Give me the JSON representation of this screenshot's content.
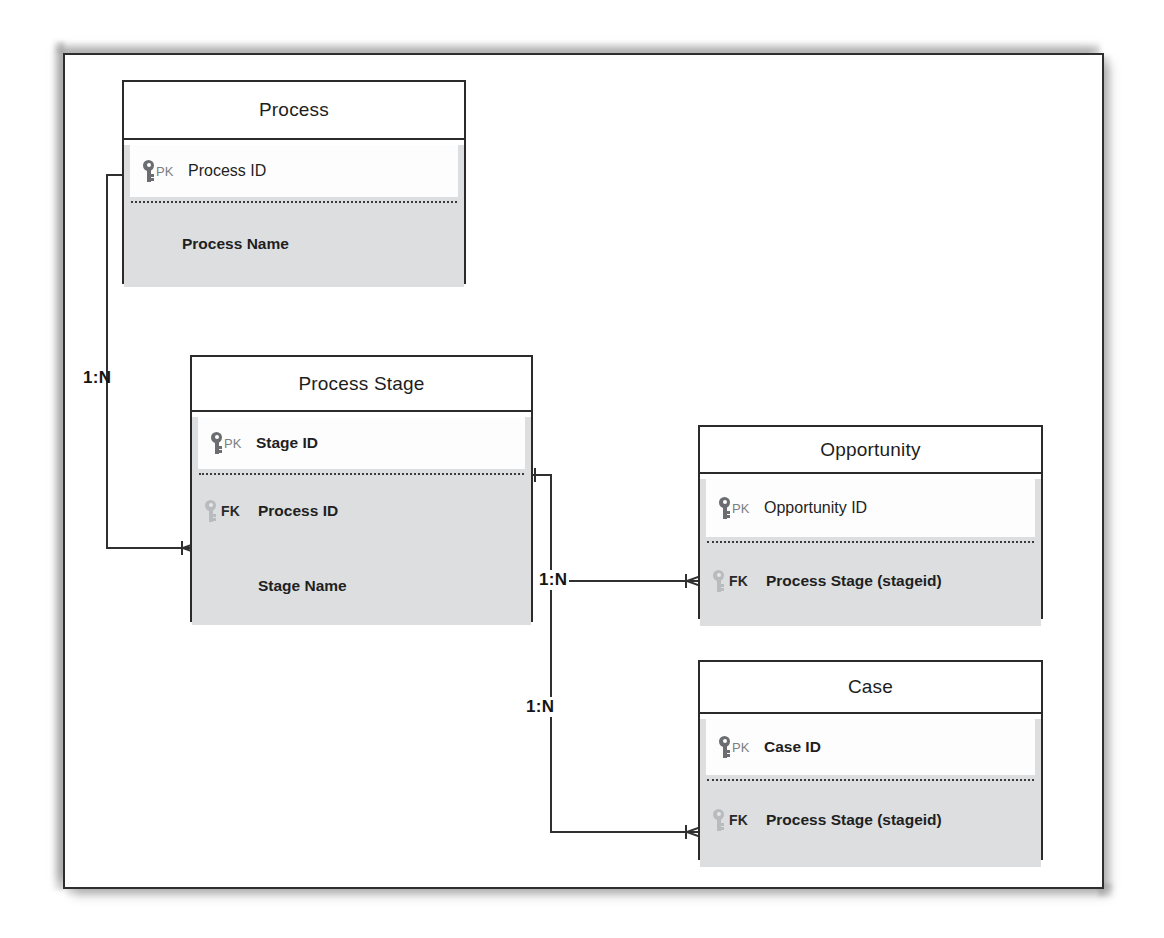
{
  "diagram": {
    "title_present": false,
    "notation": "crow's foot ER diagram",
    "colors": {
      "entity_border": "#2b2b2b",
      "entity_header_bg": "#ffffff",
      "entity_body_bg": "#dcdee0",
      "pk_band_bg": "#fdfdfd",
      "connector": "#303030",
      "pk_key_icon": "#6b6d70",
      "fk_key_icon": "#b9bcbf",
      "text": "#1f1f1f"
    },
    "entities": [
      {
        "id": "process",
        "name": "Process",
        "pk": {
          "tag": "PK",
          "label": "Process ID",
          "icon": "key-icon"
        },
        "attributes": [
          {
            "tag": "",
            "label": "Process Name",
            "icon": ""
          }
        ]
      },
      {
        "id": "process-stage",
        "name": "Process Stage",
        "pk": {
          "tag": "PK",
          "label": "Stage ID",
          "icon": "key-icon"
        },
        "attributes": [
          {
            "tag": "FK",
            "label": "Process ID",
            "icon": "key-icon"
          },
          {
            "tag": "",
            "label": "Stage Name",
            "icon": ""
          }
        ]
      },
      {
        "id": "opportunity",
        "name": "Opportunity",
        "pk": {
          "tag": "PK",
          "label": "Opportunity ID",
          "icon": "key-icon"
        },
        "attributes": [
          {
            "tag": "FK",
            "label": "Process Stage (stageid)",
            "icon": "key-icon"
          }
        ]
      },
      {
        "id": "case",
        "name": "Case",
        "pk": {
          "tag": "PK",
          "label": "Case ID",
          "icon": "key-icon"
        },
        "attributes": [
          {
            "tag": "FK",
            "label": "Process Stage (stageid)",
            "icon": "key-icon"
          }
        ]
      }
    ],
    "relationships": [
      {
        "id": "process-to-stage",
        "from": "Process.Process ID",
        "to": "Process Stage.Process ID",
        "cardinality": "1:N"
      },
      {
        "id": "stage-to-opportunity",
        "from": "Process Stage.Stage ID",
        "to": "Opportunity.Process Stage (stageid)",
        "cardinality": "1:N"
      },
      {
        "id": "stage-to-case",
        "from": "Process Stage.Stage ID",
        "to": "Case.Process Stage (stageid)",
        "cardinality": "1:N"
      }
    ]
  }
}
